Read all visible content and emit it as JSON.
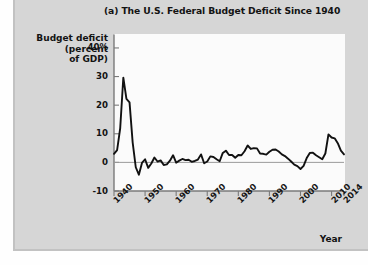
{
  "figure": {
    "title": "(a) The U.S. Federal Budget Deficit Since 1940",
    "y_axis_title_line1": "Budget deficit",
    "y_axis_title_line2": "(percent",
    "y_axis_title_line3": "of GDP)",
    "x_axis_title": "Year",
    "background_color": "#d6d6d6",
    "plot_background_color": "#fbfbfb",
    "line_color": "#111111",
    "axis_color": "#7a7a7a"
  },
  "chart_data": {
    "type": "line",
    "title": "(a) The U.S. Federal Budget Deficit Since 1940",
    "xlabel": "Year",
    "ylabel": "Budget deficit (percent of GDP)",
    "xlim": [
      1940,
      2014
    ],
    "ylim": [
      -10,
      44
    ],
    "grid": false,
    "legend": "none",
    "ytick_labels": [
      "40%",
      "30",
      "20",
      "10",
      "0",
      "-10"
    ],
    "ytick_values": [
      40,
      30,
      20,
      10,
      0,
      -10
    ],
    "xtick_labels": [
      "1940",
      "1950",
      "1960",
      "1970",
      "1980",
      "1990",
      "2000",
      "2010",
      "2014"
    ],
    "xtick_values": [
      1940,
      1950,
      1960,
      1970,
      1980,
      1990,
      2000,
      2010,
      2014
    ],
    "series": [
      {
        "name": "Federal budget deficit (percent of GDP)",
        "x": [
          1940,
          1941,
          1942,
          1943,
          1944,
          1945,
          1946,
          1947,
          1948,
          1949,
          1950,
          1951,
          1952,
          1953,
          1954,
          1955,
          1956,
          1957,
          1958,
          1959,
          1960,
          1961,
          1962,
          1963,
          1964,
          1965,
          1966,
          1967,
          1968,
          1969,
          1970,
          1971,
          1972,
          1973,
          1974,
          1975,
          1976,
          1977,
          1978,
          1979,
          1980,
          1981,
          1982,
          1983,
          1984,
          1985,
          1986,
          1987,
          1988,
          1989,
          1990,
          1991,
          1992,
          1993,
          1994,
          1995,
          1996,
          1997,
          1998,
          1999,
          2000,
          2001,
          2002,
          2003,
          2004,
          2005,
          2006,
          2007,
          2008,
          2009,
          2010,
          2011,
          2012,
          2013,
          2014
        ],
        "values": [
          3.0,
          4.3,
          12.0,
          29.6,
          22.2,
          21.0,
          7.0,
          -1.7,
          -4.3,
          -0.2,
          1.1,
          -1.9,
          -0.4,
          1.7,
          0.3,
          0.7,
          -0.9,
          -0.7,
          0.6,
          2.5,
          -0.1,
          0.6,
          1.2,
          0.8,
          0.9,
          0.2,
          0.5,
          1.0,
          2.8,
          -0.3,
          0.3,
          2.1,
          1.9,
          1.1,
          0.4,
          3.3,
          4.1,
          2.6,
          2.6,
          1.6,
          2.6,
          2.5,
          3.9,
          5.9,
          4.7,
          5.0,
          4.9,
          3.1,
          3.0,
          2.7,
          3.7,
          4.4,
          4.5,
          3.8,
          2.8,
          2.2,
          1.3,
          0.3,
          -0.8,
          -1.3,
          -2.3,
          -1.2,
          1.5,
          3.3,
          3.4,
          2.5,
          1.8,
          1.1,
          3.1,
          9.8,
          8.7,
          8.4,
          6.7,
          4.1,
          2.8
        ]
      }
    ],
    "annotations": []
  }
}
